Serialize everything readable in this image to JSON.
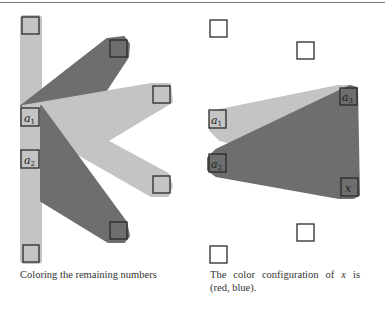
{
  "colors": {
    "light_region": "#c4c4c4",
    "dark_region": "#6e6e6e",
    "box_stroke": "#2a2a2a",
    "rule": "#777777"
  },
  "left_panel": {
    "labels": {
      "a1": "a",
      "a1_sub": "1",
      "a2": "a",
      "a2_sub": "2"
    },
    "caption": "Coloring the remaining numbers"
  },
  "right_panel": {
    "labels": {
      "a1": "a",
      "a1_sub": "1",
      "a2": "a",
      "a2_sub": "2",
      "a3": "a",
      "a3_sub": "3",
      "x": "x"
    },
    "caption_pre": "The color configuration of ",
    "caption_var": "x",
    "caption_post": " is (red, blue)."
  }
}
